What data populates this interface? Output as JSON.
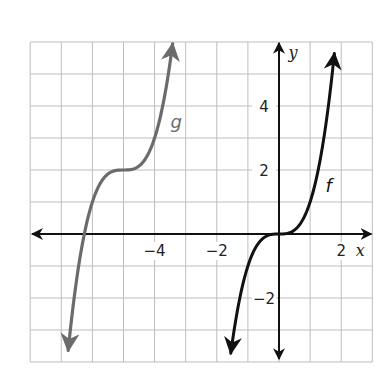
{
  "chart_data": {
    "type": "line",
    "title": "",
    "xlabel": "x",
    "ylabel": "y",
    "xlim": [
      -8,
      3
    ],
    "ylim": [
      -4,
      6
    ],
    "grid": true,
    "grid_step": 1,
    "x_ticks": [
      {
        "value": -4,
        "label": "−4"
      },
      {
        "value": -2,
        "label": "−2"
      },
      {
        "value": 2,
        "label": "2"
      }
    ],
    "y_ticks": [
      {
        "value": 4,
        "label": "4"
      },
      {
        "value": 2,
        "label": "2"
      },
      {
        "value": -2,
        "label": "−2"
      }
    ],
    "series": [
      {
        "name": "f",
        "label": "f",
        "expression": "f(x) = x^3",
        "color": "#111111",
        "x_range": [
          -1.55,
          1.78
        ],
        "points": [
          [
            -1.55,
            -3.72
          ],
          [
            -1,
            -1
          ],
          [
            -0.5,
            -0.125
          ],
          [
            0,
            0
          ],
          [
            0.5,
            0.125
          ],
          [
            1,
            1
          ],
          [
            1.5,
            3.375
          ],
          [
            1.78,
            5.64
          ]
        ]
      },
      {
        "name": "g",
        "label": "g",
        "expression": "g(x) = (x + 5)^3 + 2",
        "color": "#6b6b6b",
        "x_range": [
          -6.78,
          -3.42
        ],
        "points": [
          [
            -6.78,
            -3.64
          ],
          [
            -6.26,
            0
          ],
          [
            -6,
            1
          ],
          [
            -5.5,
            1.875
          ],
          [
            -5,
            2
          ],
          [
            -4.5,
            2.125
          ],
          [
            -4,
            3
          ],
          [
            -3.5,
            5.375
          ],
          [
            -3.42,
            5.94
          ]
        ]
      }
    ],
    "annotations": [
      {
        "text": "g",
        "x": -3.4,
        "y": 3.5
      },
      {
        "text": "f",
        "x": 1.5,
        "y": 1.5
      }
    ]
  }
}
